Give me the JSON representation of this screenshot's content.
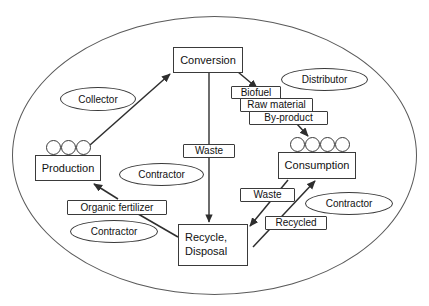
{
  "diagram": {
    "boundary": {
      "name": "system-boundary",
      "x": 12,
      "y": 16,
      "w": 405,
      "h": 279
    },
    "stroke_color": "#3a3a3a",
    "boundary_color": "#5a5a5a",
    "background": "#ffffff",
    "nodes": [
      {
        "id": "conversion",
        "label": "Conversion",
        "x": 173,
        "y": 47,
        "w": 70,
        "h": 26,
        "kind": "process"
      },
      {
        "id": "production",
        "label": "Production",
        "x": 35,
        "y": 155,
        "w": 66,
        "h": 26,
        "kind": "process"
      },
      {
        "id": "consumption",
        "label": "Consumption",
        "x": 278,
        "y": 152,
        "w": 78,
        "h": 27,
        "kind": "process"
      },
      {
        "id": "recycle",
        "label": "Recycle,\nDisposal",
        "line1": "Recycle,",
        "line2": "Disposal",
        "x": 178,
        "y": 224,
        "w": 70,
        "h": 42,
        "kind": "process"
      }
    ],
    "flow_labels": [
      {
        "id": "biofuel",
        "label": "Biofuel",
        "x": 231,
        "y": 86,
        "w": 50,
        "h": 13
      },
      {
        "id": "raw-material",
        "label": "Raw material",
        "x": 240,
        "y": 98,
        "w": 73,
        "h": 14
      },
      {
        "id": "by-product",
        "label": "By-product",
        "x": 249,
        "y": 111,
        "w": 79,
        "h": 14
      },
      {
        "id": "waste-center",
        "label": "Waste",
        "x": 183,
        "y": 144,
        "w": 52,
        "h": 14
      },
      {
        "id": "waste-right",
        "label": "Waste",
        "x": 240,
        "y": 188,
        "w": 55,
        "h": 14
      },
      {
        "id": "recycled",
        "label": "Recycled",
        "x": 265,
        "y": 216,
        "w": 62,
        "h": 14
      },
      {
        "id": "organic-fertilizer",
        "label": "Organic fertilizer",
        "x": 67,
        "y": 200,
        "w": 100,
        "h": 15
      }
    ],
    "actors": [
      {
        "id": "collector",
        "label": "Collector",
        "x": 60,
        "y": 87,
        "w": 76,
        "h": 24
      },
      {
        "id": "distributor",
        "label": "Distributor",
        "x": 281,
        "y": 68,
        "w": 87,
        "h": 23
      },
      {
        "id": "contractor-center",
        "label": "Contractor",
        "x": 119,
        "y": 163,
        "w": 85,
        "h": 23
      },
      {
        "id": "contractor-left",
        "label": "Contractor",
        "x": 70,
        "y": 220,
        "w": 88,
        "h": 23
      },
      {
        "id": "contractor-right",
        "label": "Contractor",
        "x": 305,
        "y": 192,
        "w": 88,
        "h": 23
      }
    ],
    "dot_groups": [
      {
        "id": "production-units",
        "count": 3,
        "x": 46,
        "y": 140
      },
      {
        "id": "consumption-units",
        "count": 4,
        "x": 290,
        "y": 137
      }
    ],
    "arrows": [
      {
        "id": "production-to-conversion",
        "from": "production",
        "to": "conversion",
        "label": ""
      },
      {
        "id": "conversion-to-biofuel",
        "from": "conversion",
        "to": "biofuel",
        "label": "Biofuel"
      },
      {
        "id": "byproduct-to-consumption",
        "from": "by-product",
        "to": "consumption",
        "label": "By-product"
      },
      {
        "id": "conversion-to-recycle",
        "from": "conversion",
        "to": "recycle",
        "label": "Waste"
      },
      {
        "id": "consumption-to-recycle",
        "from": "consumption",
        "to": "recycle",
        "label": "Waste"
      },
      {
        "id": "recycle-to-consumption",
        "from": "recycle",
        "to": "consumption",
        "label": "Recycled"
      },
      {
        "id": "recycle-to-production",
        "from": "recycle",
        "to": "production",
        "label": "Organic fertilizer"
      }
    ]
  }
}
